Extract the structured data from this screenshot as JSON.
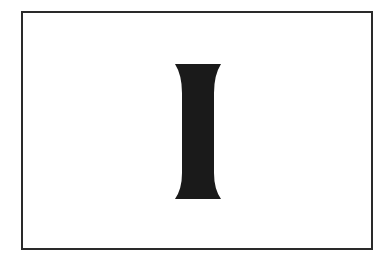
{
  "figure": {
    "glyph": "I",
    "colors": {
      "frame": "#2a2a2a",
      "shape": "#1a1a1a",
      "background": "#ffffff"
    }
  }
}
